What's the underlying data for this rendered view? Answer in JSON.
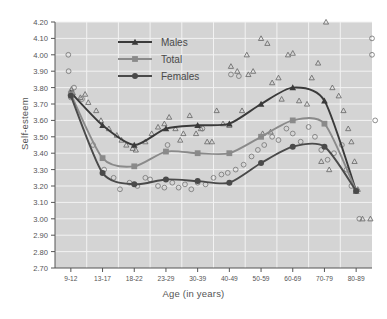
{
  "chart_data": {
    "type": "line",
    "title": "",
    "xlabel": "Age (in years)",
    "ylabel": "Self-esteem",
    "categories": [
      "9-12",
      "13-17",
      "18-22",
      "23-29",
      "30-39",
      "40-49",
      "50-59",
      "60-69",
      "70-79",
      "80-89"
    ],
    "ylim": [
      2.7,
      4.2
    ],
    "ytick_step": 0.1,
    "yticks": [
      "2.70",
      "2.80",
      "2.90",
      "3.00",
      "3.10",
      "3.20",
      "3.30",
      "3.40",
      "3.50",
      "3.60",
      "3.70",
      "3.80",
      "3.90",
      "4.00",
      "4.10",
      "4.20"
    ],
    "grid": true,
    "legend_position": "top-center",
    "series": [
      {
        "name": "Males",
        "marker": "triangle",
        "color": "#3a3a3a",
        "values": [
          3.77,
          3.57,
          3.45,
          3.55,
          3.57,
          3.58,
          3.7,
          3.8,
          3.72,
          3.17
        ]
      },
      {
        "name": "Total",
        "marker": "square",
        "color": "#8a8a8a",
        "values": [
          3.76,
          3.37,
          3.32,
          3.41,
          3.4,
          3.4,
          3.5,
          3.6,
          3.58,
          3.17
        ]
      },
      {
        "name": "Females",
        "marker": "circle",
        "color": "#4a4a4a",
        "values": [
          3.75,
          3.28,
          3.21,
          3.24,
          3.23,
          3.22,
          3.34,
          3.44,
          3.44,
          3.17
        ]
      }
    ],
    "scatter": {
      "males": {
        "marker": "open-triangle",
        "points": [
          [
            0.02,
            3.79
          ],
          [
            0.06,
            3.77
          ],
          [
            0.3,
            3.74
          ],
          [
            0.55,
            3.71
          ],
          [
            0.95,
            3.6
          ],
          [
            1.45,
            3.51
          ],
          [
            1.6,
            3.48
          ],
          [
            1.75,
            3.45
          ],
          [
            1.95,
            3.43
          ],
          [
            2.05,
            3.42
          ],
          [
            2.55,
            3.52
          ],
          [
            2.75,
            3.56
          ],
          [
            2.95,
            3.58
          ],
          [
            3.1,
            3.62
          ],
          [
            3.3,
            3.55
          ],
          [
            3.55,
            3.52
          ],
          [
            3.75,
            3.63
          ],
          [
            3.95,
            3.52
          ],
          [
            4.1,
            3.55
          ],
          [
            4.3,
            3.47
          ],
          [
            4.45,
            3.47
          ],
          [
            4.6,
            3.66
          ],
          [
            4.8,
            3.58
          ],
          [
            5.0,
            3.57
          ],
          [
            5.05,
            3.93
          ],
          [
            5.25,
            3.9
          ],
          [
            5.4,
            3.66
          ],
          [
            5.55,
            4.0
          ],
          [
            5.6,
            3.88
          ],
          [
            5.75,
            3.9
          ],
          [
            6.0,
            4.1
          ],
          [
            6.2,
            4.07
          ],
          [
            6.35,
            3.83
          ],
          [
            6.55,
            3.86
          ],
          [
            6.65,
            3.73
          ],
          [
            6.85,
            4.0
          ],
          [
            7.0,
            4.01
          ],
          [
            7.2,
            3.72
          ],
          [
            7.45,
            3.7
          ],
          [
            7.6,
            3.86
          ],
          [
            7.8,
            3.95
          ],
          [
            8.05,
            4.2
          ],
          [
            8.25,
            3.8
          ],
          [
            8.45,
            3.75
          ],
          [
            8.6,
            3.66
          ],
          [
            8.75,
            3.55
          ],
          [
            8.85,
            3.47
          ],
          [
            8.95,
            3.35
          ],
          [
            9.05,
            3.18
          ],
          [
            9.2,
            3.0
          ],
          [
            9.45,
            3.0
          ],
          [
            8.15,
            3.3
          ],
          [
            7.9,
            3.35
          ],
          [
            6.05,
            3.52
          ],
          [
            6.3,
            3.53
          ],
          [
            3.45,
            3.48
          ],
          [
            2.35,
            3.47
          ],
          [
            1.2,
            3.55
          ],
          [
            0.8,
            3.66
          ],
          [
            0.45,
            3.76
          ]
        ]
      },
      "females": {
        "marker": "open-circle",
        "points": [
          [
            -0.08,
            4.0
          ],
          [
            -0.07,
            3.9
          ],
          [
            0.0,
            3.74
          ],
          [
            0.1,
            3.8
          ],
          [
            0.35,
            3.73
          ],
          [
            0.7,
            3.45
          ],
          [
            1.05,
            3.3
          ],
          [
            1.35,
            3.25
          ],
          [
            1.55,
            3.18
          ],
          [
            1.85,
            3.22
          ],
          [
            2.1,
            3.2
          ],
          [
            2.35,
            3.25
          ],
          [
            2.5,
            3.24
          ],
          [
            2.75,
            3.2
          ],
          [
            2.95,
            3.19
          ],
          [
            3.2,
            3.22
          ],
          [
            3.4,
            3.19
          ],
          [
            3.6,
            3.21
          ],
          [
            3.8,
            3.18
          ],
          [
            4.0,
            3.22
          ],
          [
            4.25,
            3.21
          ],
          [
            4.5,
            3.25
          ],
          [
            4.75,
            3.27
          ],
          [
            4.95,
            3.28
          ],
          [
            5.2,
            3.3
          ],
          [
            5.45,
            3.33
          ],
          [
            5.7,
            3.38
          ],
          [
            5.9,
            3.42
          ],
          [
            6.1,
            3.45
          ],
          [
            6.35,
            3.5
          ],
          [
            6.55,
            3.48
          ],
          [
            6.8,
            3.55
          ],
          [
            7.0,
            3.52
          ],
          [
            7.25,
            3.47
          ],
          [
            7.5,
            3.56
          ],
          [
            7.7,
            3.5
          ],
          [
            7.9,
            3.42
          ],
          [
            8.1,
            3.36
          ],
          [
            8.3,
            3.4
          ],
          [
            8.55,
            3.45
          ],
          [
            8.7,
            3.3
          ],
          [
            8.85,
            3.2
          ],
          [
            9.1,
            3.0
          ],
          [
            9.5,
            4.1
          ],
          [
            9.5,
            4.0
          ],
          [
            9.6,
            3.6
          ],
          [
            5.05,
            3.88
          ],
          [
            5.3,
            3.87
          ],
          [
            4.15,
            3.55
          ],
          [
            3.05,
            3.45
          ]
        ]
      }
    }
  },
  "legend": {
    "items": [
      {
        "label": "Males"
      },
      {
        "label": "Total"
      },
      {
        "label": "Females"
      }
    ]
  },
  "axes": {
    "y_title": "Self-esteem",
    "x_title": "Age (in years)"
  },
  "colors": {
    "plot_background": "#d4d4d4",
    "gridline": "#f2f2f2",
    "males": "#3a3a3a",
    "total": "#8a8a8a",
    "females": "#4a4a4a",
    "text": "#555555"
  }
}
